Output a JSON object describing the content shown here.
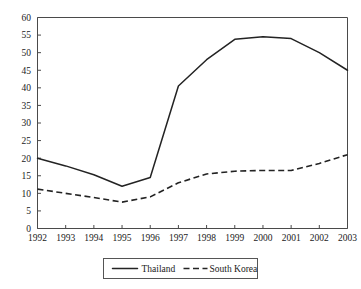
{
  "chart_data": {
    "type": "line",
    "title": "",
    "subtitle": "",
    "xlabel": "",
    "ylabel": "",
    "categories": [
      "1992",
      "1993",
      "1994",
      "1995",
      "1996",
      "1997",
      "1998",
      "1999",
      "2000",
      "2001",
      "2002",
      "2003"
    ],
    "x": [
      1992,
      1993,
      1994,
      1995,
      1996,
      1997,
      1998,
      1999,
      2000,
      2001,
      2002,
      2003
    ],
    "xlim": [
      1992,
      2003
    ],
    "ylim": [
      0,
      60
    ],
    "ytick_step": 5,
    "yticks": [
      "0",
      "5",
      "10",
      "15",
      "20",
      "25",
      "30",
      "35",
      "40",
      "45",
      "50",
      "55",
      "60"
    ],
    "ytick_values": [
      0,
      5,
      10,
      15,
      20,
      25,
      30,
      35,
      40,
      45,
      50,
      55,
      60
    ],
    "grid": false,
    "legend_position": "bottom",
    "series": [
      {
        "name": "Thailand",
        "style": "solid",
        "color": "#232323",
        "values": [
          20.0,
          17.8,
          15.3,
          12.0,
          14.5,
          40.5,
          48.0,
          53.8,
          54.5,
          54.0,
          50.0,
          45.0
        ]
      },
      {
        "name": "South Korea",
        "style": "dashed",
        "color": "#232323",
        "values": [
          11.2,
          10.0,
          8.8,
          7.5,
          9.0,
          13.0,
          15.5,
          16.3,
          16.5,
          16.5,
          18.5,
          21.0
        ]
      }
    ]
  },
  "legend": {
    "items": [
      {
        "label": "Thailand",
        "style": "solid"
      },
      {
        "label": "South Korea",
        "style": "dashed"
      }
    ]
  }
}
